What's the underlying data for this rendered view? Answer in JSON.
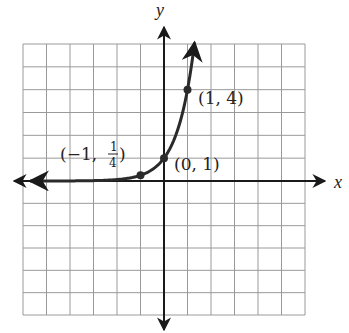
{
  "chart_data": {
    "type": "line",
    "title": "",
    "function": "y = 4^x",
    "xlabel": "x",
    "ylabel": "y",
    "xlim": [
      -6,
      6
    ],
    "ylim": [
      -6,
      6
    ],
    "grid": true,
    "grid_step": 1,
    "tick_labels": false,
    "points": [
      {
        "x": -1,
        "y": 0.25,
        "label": "(−1, 1/4)"
      },
      {
        "x": 0,
        "y": 1,
        "label": "(0, 1)"
      },
      {
        "x": 1,
        "y": 4,
        "label": "(1, 4)"
      }
    ],
    "curve_arrows": [
      "left",
      "up"
    ]
  },
  "labels": {
    "x_axis": "x",
    "y_axis": "y",
    "p1_open": "(−1, ",
    "p1_num": "1",
    "p1_den": "4",
    "p1_close": ")",
    "p2": "(0, 1)",
    "p3": "(1, 4)"
  },
  "colors": {
    "grid": "#9a9a9a",
    "axis": "#1a1a1a",
    "curve": "#2a2a2a",
    "text": "#222222"
  }
}
